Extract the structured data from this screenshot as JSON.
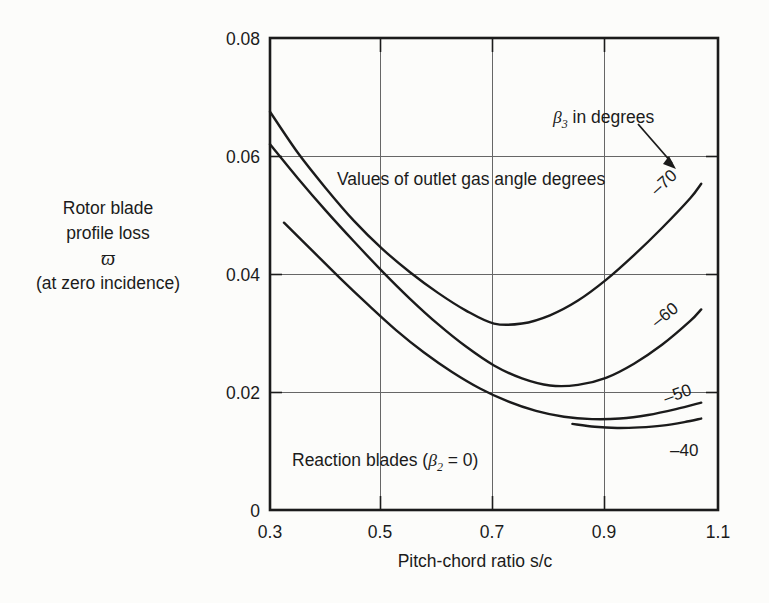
{
  "figure": {
    "background_color": "#fcfcfa",
    "line_color": "#1b1b1b",
    "grid_color": "#5a5a5a"
  },
  "axis_title_y_lines": {
    "line1": "Rotor blade",
    "line2": "profile loss",
    "line3": "ϖ",
    "line4": "(at zero incidence)"
  },
  "axis_title_x": "Pitch-chord ratio s/c",
  "ticks": {
    "x": [
      "0.3",
      "0.5",
      "0.7",
      "0.9",
      "1.1"
    ],
    "y": [
      "0",
      "0.02",
      "0.04",
      "0.06",
      "0.08"
    ]
  },
  "annotations": {
    "beta3_note_prefix": "β",
    "beta3_note_sub": "3",
    "beta3_note_rest": " in degrees",
    "outlet_note": "Values of outlet gas angle degrees",
    "reaction_prefix": "Reaction blades (",
    "reaction_beta": "β",
    "reaction_sub": "2",
    "reaction_suffix": " = 0)"
  },
  "curve_labels": {
    "c70": "–70",
    "c60": "–60",
    "c50": "–50",
    "c40": "–40"
  },
  "chart_data": {
    "type": "line",
    "title": "",
    "xlabel": "Pitch-chord ratio s/c",
    "ylabel": "Rotor blade profile loss ϖ (at zero incidence)",
    "xlim": [
      0.3,
      1.1
    ],
    "ylim": [
      0,
      0.08
    ],
    "xticks": [
      0.3,
      0.5,
      0.7,
      0.9,
      1.1
    ],
    "yticks": [
      0,
      0.02,
      0.04,
      0.06,
      0.08
    ],
    "grid": true,
    "legend": "inline curve labels at right ends",
    "annotations": [
      "β₃ in degrees",
      "Values of outlet gas angle degrees",
      "Reaction blades (β₂ = 0)"
    ],
    "series": [
      {
        "name": "–70",
        "x": [
          0.3,
          0.35,
          0.4,
          0.45,
          0.5,
          0.55,
          0.6,
          0.65,
          0.7,
          0.75,
          0.8,
          0.85,
          0.9,
          0.95,
          1.0,
          1.05,
          1.07
        ],
        "y": [
          0.0675,
          0.0605,
          0.0545,
          0.049,
          0.0443,
          0.0403,
          0.0368,
          0.0338,
          0.0316,
          0.0316,
          0.033,
          0.0355,
          0.039,
          0.0432,
          0.0478,
          0.0528,
          0.0553
        ]
      },
      {
        "name": "–60",
        "x": [
          0.3,
          0.35,
          0.4,
          0.45,
          0.5,
          0.55,
          0.6,
          0.65,
          0.7,
          0.75,
          0.8,
          0.85,
          0.9,
          0.95,
          1.0,
          1.05,
          1.07
        ],
        "y": [
          0.062,
          0.0562,
          0.0507,
          0.0455,
          0.0405,
          0.0358,
          0.0315,
          0.0277,
          0.0245,
          0.0223,
          0.0211,
          0.0212,
          0.0224,
          0.0248,
          0.028,
          0.032,
          0.034
        ]
      },
      {
        "name": "–50",
        "x": [
          0.325,
          0.375,
          0.425,
          0.475,
          0.525,
          0.575,
          0.625,
          0.675,
          0.725,
          0.775,
          0.825,
          0.875,
          0.925,
          0.975,
          1.025,
          1.07
        ],
        "y": [
          0.0487,
          0.044,
          0.0393,
          0.0348,
          0.0305,
          0.0267,
          0.0234,
          0.0206,
          0.0184,
          0.0168,
          0.0158,
          0.0154,
          0.0155,
          0.0161,
          0.0171,
          0.0182
        ]
      },
      {
        "name": "–40",
        "x": [
          0.84,
          0.88,
          0.92,
          0.96,
          1.0,
          1.04,
          1.07
        ],
        "y": [
          0.0146,
          0.0141,
          0.0139,
          0.014,
          0.0143,
          0.0149,
          0.0155
        ]
      }
    ]
  }
}
